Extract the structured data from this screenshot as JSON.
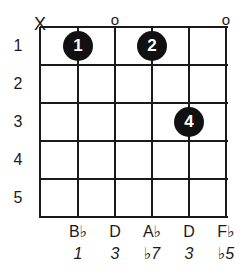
{
  "chord_diagram": {
    "fret_numbers": [
      "1",
      "2",
      "3",
      "4",
      "5"
    ],
    "string_markers": [
      {
        "string": 6,
        "symbol": "X",
        "meaning": "muted"
      },
      {
        "string": 4,
        "symbol": "o",
        "meaning": "open"
      },
      {
        "string": 1,
        "symbol": "o",
        "meaning": "open"
      }
    ],
    "finger_dots": [
      {
        "string": 5,
        "fret": 1,
        "finger": "1"
      },
      {
        "string": 3,
        "fret": 1,
        "finger": "2"
      },
      {
        "string": 2,
        "fret": 3,
        "finger": "4"
      }
    ],
    "notes": [
      "",
      "B♭",
      "D",
      "A♭",
      "D",
      "F♭"
    ],
    "intervals": [
      "",
      "1",
      "3",
      "♭7",
      "3",
      "♭5"
    ],
    "colors": {
      "line": "#1a1a1a",
      "dot": "#111111",
      "dot_text": "#ffffff",
      "background": "#ffffff"
    }
  }
}
